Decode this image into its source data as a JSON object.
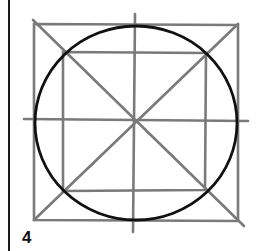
{
  "figure": {
    "step_number": "4",
    "colors": {
      "guide_lines": "#7a7a7a",
      "circle": "#111111",
      "border": "#1a1a1a"
    },
    "outer_square": {
      "x1": 33,
      "y1": 24,
      "x2": 238,
      "y2": 220
    },
    "inner_square": {
      "x1": 63,
      "y1": 52,
      "x2": 205,
      "y2": 190
    },
    "circle": {
      "cx": 136,
      "cy": 122,
      "rx": 102,
      "ry": 97
    }
  }
}
